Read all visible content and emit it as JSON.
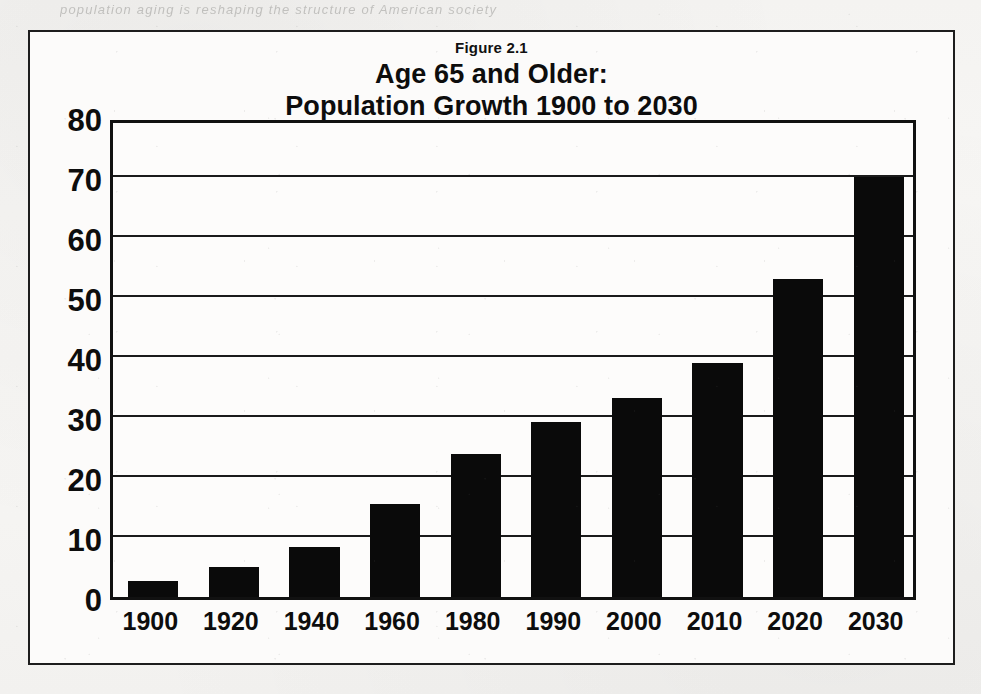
{
  "figure": {
    "number_label": "Figure 2.1",
    "title_line1": "Age 65 and Older:",
    "title_line2": "Population Growth 1900 to 2030",
    "bleed_text": "population aging is reshaping the structure of American society",
    "frame_color": "#1d1d1d",
    "bar_color": "#0a0a0a",
    "paper_color": "#f5f4f2"
  },
  "chart_data": {
    "type": "bar",
    "title": "Age 65 and Older: Population Growth 1900 to 2030",
    "subtitle": "Figure 2.1",
    "xlabel": "",
    "ylabel": "",
    "categories": [
      "1900",
      "1920",
      "1940",
      "1960",
      "1980",
      "1990",
      "2000",
      "2010",
      "2020",
      "2030"
    ],
    "values": [
      2.6,
      5.0,
      8.4,
      15.5,
      23.8,
      29.1,
      33.1,
      39.0,
      53.0,
      70.0
    ],
    "ylim": [
      0,
      80
    ],
    "yticks": [
      0,
      10,
      20,
      30,
      40,
      50,
      60,
      70,
      80
    ],
    "ytick_labels": [
      "0",
      "10",
      "20",
      "30",
      "40",
      "50",
      "60",
      "70",
      "80"
    ],
    "grid": true,
    "legend": false,
    "legend_position": "none",
    "series": [
      {
        "name": "Population age 65 and older (millions)",
        "values": [
          2.6,
          5.0,
          8.4,
          15.5,
          23.8,
          29.1,
          33.1,
          39.0,
          53.0,
          70.0
        ]
      }
    ]
  }
}
